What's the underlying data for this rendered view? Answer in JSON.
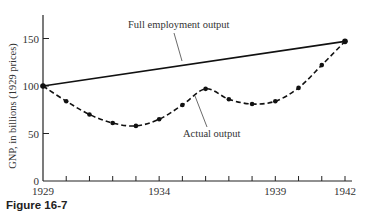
{
  "caption": "Figure 16-7",
  "chart_data": {
    "type": "line",
    "title": "",
    "xlabel": "",
    "ylabel": "GNP, in billions (1929 prices)",
    "x": [
      1929,
      1930,
      1931,
      1932,
      1933,
      1934,
      1935,
      1936,
      1937,
      1938,
      1939,
      1940,
      1941,
      1942
    ],
    "x_tick_labels": [
      "1929",
      "1934",
      "1939",
      "1942"
    ],
    "y_ticks": [
      0,
      50,
      100,
      150
    ],
    "y_tick_labels": [
      "0",
      "50",
      "100",
      "150"
    ],
    "ylim": [
      0,
      160
    ],
    "xlim": [
      1929,
      1942
    ],
    "grid": false,
    "legend": "none (series labeled by annotations)",
    "series": [
      {
        "name": "Full employment output",
        "style": "solid",
        "x": [
          1929,
          1942
        ],
        "values": [
          100,
          147
        ]
      },
      {
        "name": "Actual output",
        "style": "dashed with markers",
        "x": [
          1929,
          1930,
          1931,
          1932,
          1933,
          1934,
          1935,
          1936,
          1937,
          1938,
          1939,
          1940,
          1941,
          1942
        ],
        "values": [
          100,
          84,
          70,
          61,
          58,
          65,
          80,
          97,
          86,
          81,
          84,
          98,
          122,
          147
        ]
      }
    ],
    "annotations": [
      {
        "text": "Full employment output",
        "points_to_year": 1936
      },
      {
        "text": "Actual output",
        "points_to_year": 1935.6
      }
    ]
  }
}
